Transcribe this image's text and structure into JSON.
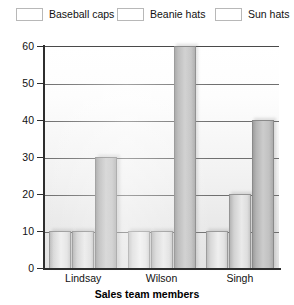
{
  "chart_data": {
    "type": "bar",
    "title": "",
    "subtitle": "",
    "xlabel": "Sales team members",
    "ylabel": "",
    "categories": [
      "Lindsay",
      "Wilson",
      "Singh"
    ],
    "series": [
      {
        "name": "Baseball caps",
        "values": [
          10,
          10,
          10
        ],
        "color": "#e3e3e3"
      },
      {
        "name": "Beanie hats",
        "values": [
          10,
          10,
          20
        ],
        "color": "#dedede"
      },
      {
        "name": "Sun hats",
        "values": [
          30,
          60,
          40
        ],
        "color": "#c2c2c2"
      }
    ],
    "ylim": [
      0,
      60
    ],
    "yticks": [
      0,
      10,
      20,
      30,
      40,
      50,
      60
    ],
    "ytick_labels": [
      "0",
      "10",
      "20",
      "30",
      "40",
      "50",
      "60"
    ],
    "grid": true,
    "grid_axis": "y",
    "legend_position": "top"
  },
  "legend": {
    "items": [
      {
        "label": "Baseball caps"
      },
      {
        "label": "Beanie hats"
      },
      {
        "label": "Sun hats"
      }
    ]
  },
  "axes": {
    "x_title": "Sales team members"
  }
}
